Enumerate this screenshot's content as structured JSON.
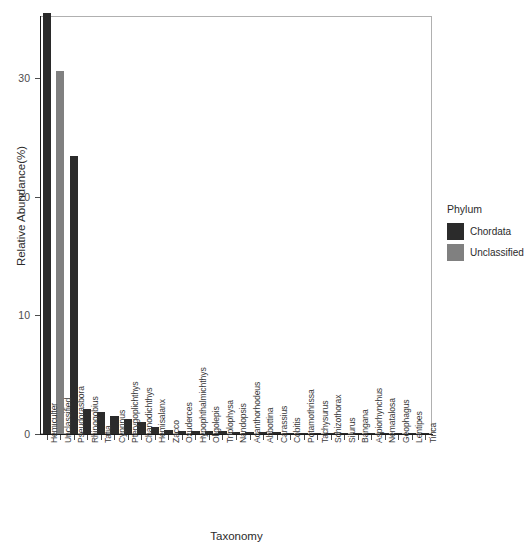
{
  "chart_data": {
    "type": "bar",
    "title": "",
    "xlabel": "Taxonomy",
    "ylabel": "Relative Abundance(%)",
    "ylim": [
      0,
      36.5
    ],
    "yticks": [
      0,
      10,
      20,
      30
    ],
    "ytick_labels": [
      "0",
      "10",
      "20",
      "30"
    ],
    "grid": false,
    "legend_position": "right",
    "legend_title": "Phylum",
    "legend_entries": [
      {
        "label": "Chordata",
        "color": "#2b2b2b"
      },
      {
        "label": "Unclassified",
        "color": "#808080"
      }
    ],
    "categories": [
      "Hemiculter",
      "Unclassified",
      "Pseudorasbora",
      "Rhinogobius",
      "Tatia",
      "Cyprinus",
      "Pterygoplichthys",
      "Chanodichthys",
      "Hemisalanx",
      "Zacco",
      "Oxuderces",
      "Hypophthalmichthys",
      "Oligolepis",
      "Triplophysa",
      "Nandopsis",
      "Acanthorhodeus",
      "Abbottina",
      "Carassius",
      "Cobitis",
      "Potamothrissa",
      "Tachysurus",
      "Schizothorax",
      "Silurus",
      "Bangana",
      "Aspiorhynchus",
      "Nematalosa",
      "Geophagus",
      "Lentipes",
      "Tinca"
    ],
    "values": [
      35.5,
      30.6,
      23.4,
      2.1,
      1.85,
      1.5,
      1.25,
      1.05,
      0.62,
      0.32,
      0.29,
      0.26,
      0.24,
      0.22,
      0.2,
      0.18,
      0.16,
      0.14,
      0.12,
      0.1,
      0.09,
      0.08,
      0.07,
      0.06,
      0.05,
      0.04,
      0.035,
      0.03,
      0.025
    ],
    "groups": [
      "Chordata",
      "Unclassified",
      "Chordata",
      "Chordata",
      "Chordata",
      "Chordata",
      "Chordata",
      "Chordata",
      "Chordata",
      "Chordata",
      "Chordata",
      "Chordata",
      "Chordata",
      "Chordata",
      "Chordata",
      "Chordata",
      "Chordata",
      "Chordata",
      "Chordata",
      "Chordata",
      "Chordata",
      "Chordata",
      "Chordata",
      "Chordata",
      "Chordata",
      "Chordata",
      "Chordata",
      "Chordata",
      "Chordata"
    ]
  }
}
